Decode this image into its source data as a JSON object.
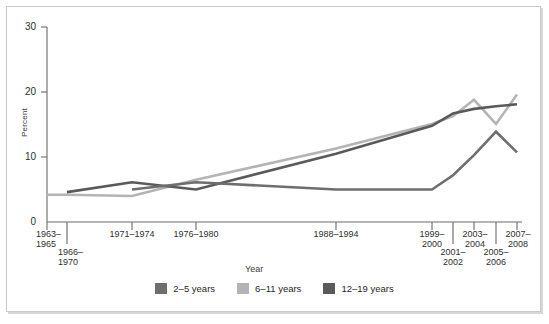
{
  "chart_data": {
    "type": "line",
    "title": "",
    "xlabel": "Year",
    "ylabel": "Percent",
    "ylim": [
      0,
      30
    ],
    "yticks": [
      0,
      10,
      20,
      30
    ],
    "grid": false,
    "legend_position": "bottom-center",
    "categories": [
      "1963-1965",
      "1966-1970",
      "1971-1974",
      "1976-1980",
      "1988-1994",
      "1999-2000",
      "2001-2002",
      "2003-2004",
      "2005-2006",
      "2007-2008"
    ],
    "tick_labels": [
      {
        "line1": "1963–",
        "line2": "1965",
        "row": 1
      },
      {
        "line1": "1966–",
        "line2": "1970",
        "row": 2
      },
      {
        "line1": "1971–1974",
        "line2": "",
        "row": 1
      },
      {
        "line1": "1976–1980",
        "line2": "",
        "row": 1
      },
      {
        "line1": "1988–1994",
        "line2": "",
        "row": 1
      },
      {
        "line1": "1999–",
        "line2": "2000",
        "row": 1
      },
      {
        "line1": "2001–",
        "line2": "2002",
        "row": 2
      },
      {
        "line1": "2003–",
        "line2": "2004",
        "row": 1
      },
      {
        "line1": "2005–",
        "line2": "2006",
        "row": 2
      },
      {
        "line1": "2007–",
        "line2": "2008",
        "row": 1
      }
    ],
    "series": [
      {
        "name": "2–5 years",
        "color": "#6e6e6e",
        "x": [
          "1971-1974",
          "1976-1980",
          "1988-1994",
          "1999-2000",
          "2001-2002",
          "2003-2004",
          "2005-2006",
          "2007-2008"
        ],
        "values": [
          5.0,
          6.1,
          5.0,
          5.0,
          7.2,
          10.3,
          13.9,
          10.7
        ]
      },
      {
        "name": "6–11 years",
        "color": "#b4b4b4",
        "x": [
          "1963-1965",
          "1966-1970",
          "1971-1974",
          "1976-1980",
          "1988-1994",
          "1999-2000",
          "2001-2002",
          "2003-2004",
          "2005-2006",
          "2007-2008"
        ],
        "values": [
          4.2,
          4.2,
          4.0,
          6.5,
          11.3,
          15.1,
          16.3,
          18.8,
          15.1,
          19.6
        ]
      },
      {
        "name": "12–19 years",
        "color": "#5a5a5a",
        "x": [
          "1966-1970",
          "1971-1974",
          "1976-1980",
          "1988-1994",
          "1999-2000",
          "2001-2002",
          "2003-2004",
          "2005-2006",
          "2007-2008"
        ],
        "values": [
          4.6,
          6.1,
          5.0,
          10.5,
          14.8,
          16.7,
          17.4,
          17.8,
          18.1
        ]
      }
    ]
  },
  "legend": {
    "items": [
      {
        "label": "2–5 years",
        "color": "#6e6e6e"
      },
      {
        "label": "6–11 years",
        "color": "#b4b4b4"
      },
      {
        "label": "12–19 years",
        "color": "#5a5a5a"
      }
    ]
  },
  "axes": {
    "y_title": "Percent",
    "x_title": "Year",
    "y_tick_labels": [
      "30",
      "20",
      "10",
      "0"
    ]
  }
}
